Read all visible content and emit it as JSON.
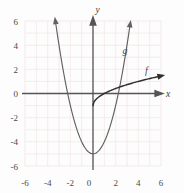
{
  "chart_data": {
    "type": "line",
    "title": "",
    "xlabel": "x",
    "ylabel": "y",
    "xlim": [
      -7,
      7
    ],
    "ylim": [
      -7,
      7
    ],
    "grid": true,
    "legend": "inline-curve-labels",
    "xticks": [
      "-6",
      "-4",
      "-2",
      "0",
      "2",
      "4",
      "6"
    ],
    "xtick_values": [
      -6,
      -4,
      -2,
      0,
      2,
      4,
      6
    ],
    "yticks": [
      "6",
      "4",
      "2",
      "0",
      "-2",
      "-4",
      "-6"
    ],
    "ytick_values": [
      6,
      4,
      2,
      0,
      -2,
      -4,
      -6
    ],
    "series": [
      {
        "name": "g",
        "label": "g",
        "equation": "y = x^2 - 5",
        "shape": "parabola-opening-up",
        "vertex": [
          0,
          -5
        ],
        "x_intercepts": [
          -2.24,
          2.24
        ],
        "y_intercept": -5,
        "arrow_ends": [
          [
            -3.32,
            6.0
          ],
          [
            3.32,
            6.0
          ]
        ],
        "label_position": [
          2.6,
          3.3
        ],
        "x": [
          -3.32,
          -3.0,
          -2.5,
          -2.0,
          -1.5,
          -1.0,
          -0.5,
          0,
          0.5,
          1.0,
          1.5,
          2.0,
          2.5,
          3.0,
          3.32
        ],
        "y": [
          6.0,
          4.0,
          1.25,
          -1.0,
          -2.75,
          -4.0,
          -4.75,
          -5.0,
          -4.75,
          -4.0,
          -2.75,
          -1.0,
          1.25,
          4.0,
          6.0
        ]
      },
      {
        "name": "f",
        "label": "f",
        "equation": "y = sqrt(x) - 1",
        "shape": "square-root-curve",
        "start_point": [
          0,
          -1
        ],
        "x_intercept": 1,
        "arrow_end": [
          6.0,
          1.45
        ],
        "label_position": [
          4.6,
          1.65
        ],
        "x": [
          0,
          0.25,
          0.5,
          1.0,
          1.5,
          2.0,
          2.5,
          3.0,
          3.5,
          4.0,
          4.5,
          5.0,
          5.5,
          6.0
        ],
        "y": [
          -1.0,
          -0.5,
          -0.29,
          0,
          0.22,
          0.41,
          0.58,
          0.73,
          0.87,
          1.0,
          1.12,
          1.24,
          1.35,
          1.45
        ]
      }
    ]
  },
  "axes": {
    "x_axis_label": "x",
    "y_axis_label": "y"
  },
  "colors": {
    "grid": "#f0dede",
    "axis": "#555555",
    "curve": "#555555",
    "text": "#444444",
    "background": "#fdfdfd"
  }
}
